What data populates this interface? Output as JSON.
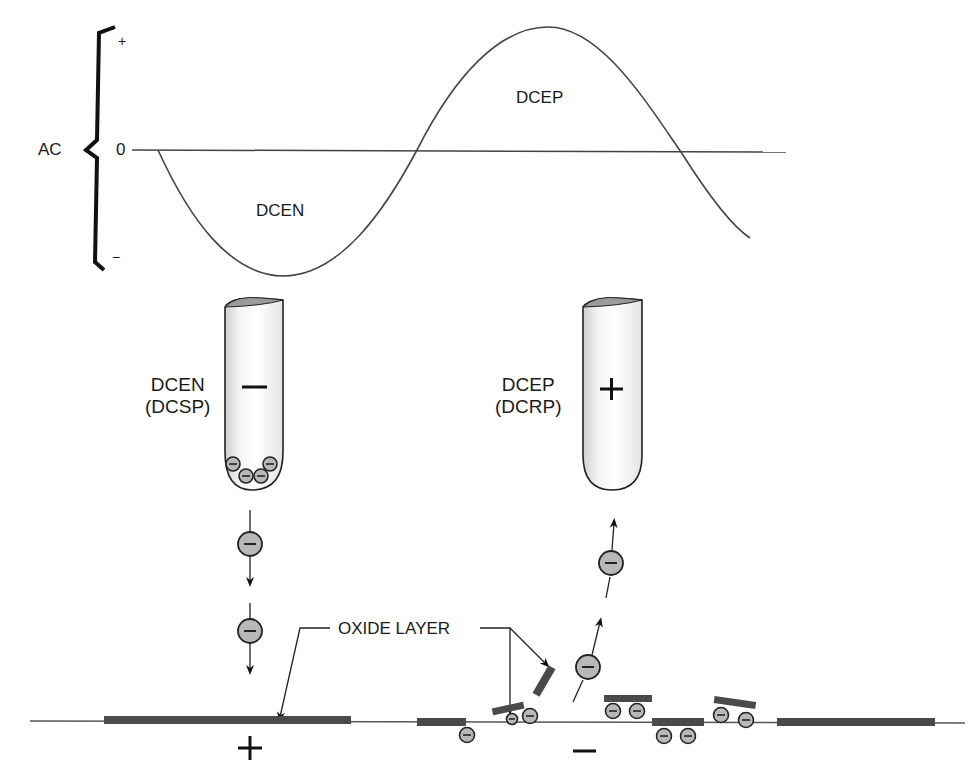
{
  "waveform": {
    "group_label": "AC",
    "axis_top": "+",
    "axis_zero": "0",
    "axis_bottom": "−",
    "negative_half_label": "DCEN",
    "positive_half_label": "DCEP"
  },
  "electrodes": [
    {
      "line1": "DCEN",
      "line2": "(DCSP)",
      "polarity": "−"
    },
    {
      "line1": "DCEP",
      "line2": "(DCRP)",
      "polarity": "+"
    }
  ],
  "oxide_label": "OXIDE LAYER",
  "workpiece": {
    "left_polarity": "+",
    "right_polarity": "−"
  },
  "colors": {
    "line": "#3a3a3a",
    "oxide": "#4a4a4a",
    "electron_fill": "#b8b8b8",
    "electrode_shade": "#d9d9d9"
  }
}
